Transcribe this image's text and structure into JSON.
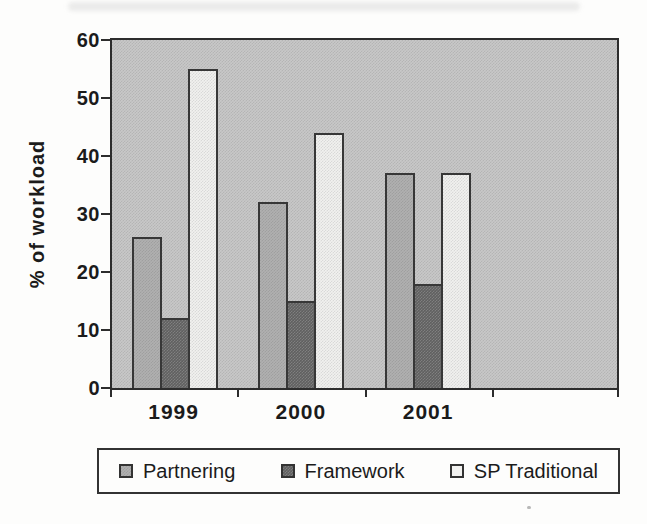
{
  "figure": {
    "kind": "scanned grouped bar chart",
    "background": "#fdfdfc",
    "axis_color": "#2d2d2d"
  },
  "chart_data": {
    "type": "bar",
    "title": "",
    "categories": [
      "1999",
      "2000",
      "2001"
    ],
    "series": [
      {
        "name": "Partnering",
        "color": "#b0b0b0",
        "values": [
          26,
          32,
          37
        ]
      },
      {
        "name": "Framework",
        "color": "#606060",
        "values": [
          12,
          15,
          18
        ]
      },
      {
        "name": "SP Traditional",
        "color": "#f1f1ef",
        "values": [
          55,
          44,
          37
        ]
      }
    ],
    "xlabel": "",
    "ylabel": "% of workload",
    "ylim": [
      0,
      60
    ],
    "yticks": [
      0,
      10,
      20,
      30,
      40,
      50,
      60
    ],
    "grid": false,
    "legend_position": "bottom",
    "plot_background": "#c8c8c8",
    "num_category_slots": 4
  }
}
